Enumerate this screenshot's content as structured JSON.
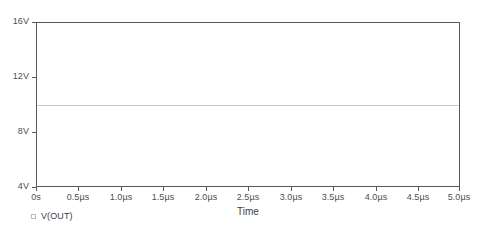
{
  "chart_data": {
    "type": "line",
    "title": "",
    "xlabel": "Time",
    "ylabel": "",
    "grid": false,
    "legend_position": "bottom-left",
    "xlim": [
      0,
      5.0
    ],
    "ylim": [
      4,
      16
    ],
    "x_unit": "µs",
    "y_unit": "V",
    "x_ticks": [
      0,
      0.5,
      1.0,
      1.5,
      2.0,
      2.5,
      3.0,
      3.5,
      4.0,
      4.5,
      5.0
    ],
    "x_tick_labels": [
      "0s",
      "0.5µs",
      "1.0µs",
      "1.5µs",
      "2.0µs",
      "2.5µs",
      "3.0µs",
      "3.5µs",
      "4.0µs",
      "4.5µs",
      "5.0µs"
    ],
    "y_ticks": [
      4,
      8,
      12,
      16
    ],
    "y_tick_labels": [
      "4V",
      "8V",
      "12V",
      "16V"
    ],
    "series": [
      {
        "name": "V(OUT)",
        "color": "#c8c9cb",
        "x": [
          0,
          0.5,
          1.0,
          1.5,
          2.0,
          2.5,
          3.0,
          3.5,
          4.0,
          4.5,
          5.0
        ],
        "values": [
          10,
          10,
          10,
          10,
          10,
          10,
          10,
          10,
          10,
          10,
          10
        ]
      }
    ]
  },
  "legend": {
    "entries": [
      {
        "label": "V(OUT)",
        "marker": "square-outline"
      }
    ]
  },
  "axis": {
    "x_title": "Time"
  },
  "colors": {
    "frame": "#555a5e",
    "tick_text": "#4a4f54",
    "trace": "#c8c9cb",
    "background": "#ffffff"
  }
}
